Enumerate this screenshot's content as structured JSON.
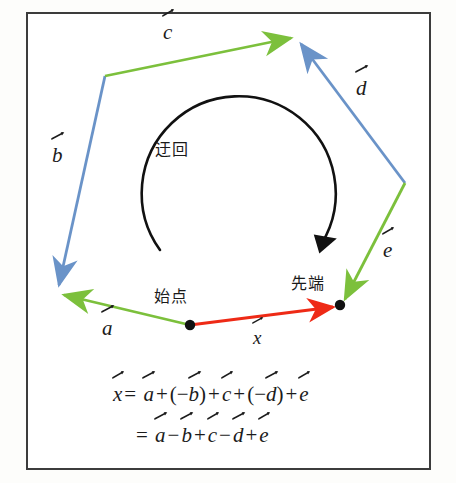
{
  "figure": {
    "type": "vector-addition-polygon-diagram",
    "background": "#ffffff",
    "border_color": "#3c3c3c",
    "colors": {
      "green": "#7cc03c",
      "blue": "#6a93c8",
      "red": "#ee2a16",
      "black": "#111111"
    },
    "annotations": {
      "detour": "迂回",
      "start_point": "始点",
      "tip_point": "先端"
    },
    "vector_labels": [
      {
        "name": "a",
        "text": "a",
        "color": "#7cc03c",
        "x": 102,
        "y": 320
      },
      {
        "name": "b",
        "text": "b",
        "color": "#6a93c8",
        "x": 52,
        "y": 147
      },
      {
        "name": "c",
        "text": "c",
        "color": "#7cc03c",
        "x": 163,
        "y": 24
      },
      {
        "name": "d",
        "text": "d",
        "color": "#6a93c8",
        "x": 355,
        "y": 80
      },
      {
        "name": "e",
        "text": "e",
        "color": "#7cc03c",
        "x": 382,
        "y": 240
      },
      {
        "name": "x",
        "text": "x",
        "color": "#ee2a16",
        "x": 252,
        "y": 330
      }
    ],
    "path_points": {
      "start": [
        190,
        325
      ],
      "v1": [
        57,
        293
      ],
      "v2": [
        105,
        76
      ],
      "v3": [
        297,
        36
      ],
      "v4": [
        405,
        183
      ],
      "end": [
        340,
        305
      ]
    },
    "segments": [
      {
        "name": "a",
        "from": "start",
        "to": "v1",
        "color": "#7cc03c",
        "arrow": "to"
      },
      {
        "name": "b",
        "from": "v2",
        "to": "v1",
        "color": "#6a93c8",
        "arrow": "to"
      },
      {
        "name": "c",
        "from": "v2",
        "to": "v3",
        "color": "#7cc03c",
        "arrow": "to"
      },
      {
        "name": "d",
        "from": "v4",
        "to": "v3",
        "color": "#6a93c8",
        "arrow": "to"
      },
      {
        "name": "e",
        "from": "v4",
        "to": "end",
        "color": "#7cc03c",
        "arrow": "to"
      },
      {
        "name": "x",
        "from": "start",
        "to": "end",
        "color": "#ee2a16",
        "arrow": "to"
      }
    ],
    "detour_arc": {
      "cx": 228,
      "cy": 185,
      "r": 97,
      "color": "#111111"
    }
  },
  "equations": {
    "line1": {
      "lhs": "x",
      "eq": "=",
      "terms": [
        "a",
        "+",
        "(",
        "−",
        "b",
        ")",
        "+",
        "c",
        "+",
        "(",
        "−",
        "d",
        ")",
        "+",
        "e"
      ]
    },
    "line2": {
      "eq": "=",
      "terms": [
        "a",
        "−",
        "b",
        "+",
        "c",
        "−",
        "d",
        "+",
        "e"
      ]
    }
  }
}
